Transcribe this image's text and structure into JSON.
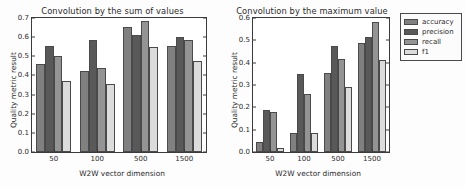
{
  "figure": {
    "background": "#ffffff"
  },
  "legend": {
    "position": "right",
    "entries": [
      {
        "label": "accuracy",
        "color": "#808080"
      },
      {
        "label": "precision",
        "color": "#595959"
      },
      {
        "label": "recall",
        "color": "#949494"
      },
      {
        "label": "f1",
        "color": "#dcdcdc"
      }
    ]
  },
  "chart_data": [
    {
      "type": "bar",
      "title": "Convolution by the sum of values",
      "xlabel": "W2W vector dimension",
      "ylabel": "Quality metric result",
      "categories": [
        "50",
        "100",
        "500",
        "1500"
      ],
      "ylim": [
        0.0,
        0.7
      ],
      "yticks": [
        "0.0",
        "0.1",
        "0.2",
        "0.3",
        "0.4",
        "0.5",
        "0.6",
        "0.7"
      ],
      "grid": false,
      "legend": "right",
      "series": [
        {
          "name": "accuracy",
          "color": "#808080",
          "values": [
            0.46,
            0.425,
            0.655,
            0.555
          ]
        },
        {
          "name": "precision",
          "color": "#595959",
          "values": [
            0.555,
            0.585,
            0.61,
            0.6
          ]
        },
        {
          "name": "recall",
          "color": "#949494",
          "values": [
            0.5,
            0.44,
            0.685,
            0.585
          ]
        },
        {
          "name": "f1",
          "color": "#dcdcdc",
          "values": [
            0.37,
            0.355,
            0.55,
            0.475
          ]
        }
      ]
    },
    {
      "type": "bar",
      "title": "Convolution by the maximum value",
      "xlabel": "W2W vector dimension",
      "ylabel": "Quality metric result",
      "categories": [
        "50",
        "100",
        "500",
        "1500"
      ],
      "ylim": [
        0.0,
        0.6
      ],
      "yticks": [
        "0.0",
        "0.1",
        "0.2",
        "0.3",
        "0.4",
        "0.5",
        "0.6"
      ],
      "grid": false,
      "legend": "right",
      "series": [
        {
          "name": "accuracy",
          "color": "#808080",
          "values": [
            0.045,
            0.085,
            0.355,
            0.49
          ]
        },
        {
          "name": "precision",
          "color": "#595959",
          "values": [
            0.19,
            0.35,
            0.475,
            0.515
          ]
        },
        {
          "name": "recall",
          "color": "#949494",
          "values": [
            0.18,
            0.26,
            0.415,
            0.58
          ]
        },
        {
          "name": "f1",
          "color": "#dcdcdc",
          "values": [
            0.02,
            0.085,
            0.29,
            0.41
          ]
        }
      ]
    }
  ]
}
